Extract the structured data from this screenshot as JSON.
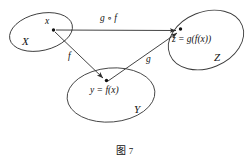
{
  "figure": {
    "caption_prefix": "图",
    "caption_number": "7",
    "sets": [
      {
        "id": "X",
        "label": "X"
      },
      {
        "id": "Y",
        "label": "Y"
      },
      {
        "id": "Z",
        "label": "Z"
      }
    ],
    "elements": [
      {
        "id": "x",
        "label": "x",
        "set": "X"
      },
      {
        "id": "y",
        "label": "y = f(x)",
        "set": "Y"
      },
      {
        "id": "z",
        "label": "z = g(f(x))",
        "set": "Z"
      }
    ],
    "arrows": [
      {
        "id": "f",
        "label": "f",
        "from": "x",
        "to": "y"
      },
      {
        "id": "g",
        "label": "g",
        "from": "y",
        "to": "z"
      },
      {
        "id": "gof",
        "label": "g ∘ f",
        "from": "x",
        "to": "z"
      }
    ],
    "colors": {
      "stroke": "#3a3a3a",
      "arrow": "#2e2e2e",
      "dot": "#111111",
      "background": "#ffffff"
    }
  }
}
